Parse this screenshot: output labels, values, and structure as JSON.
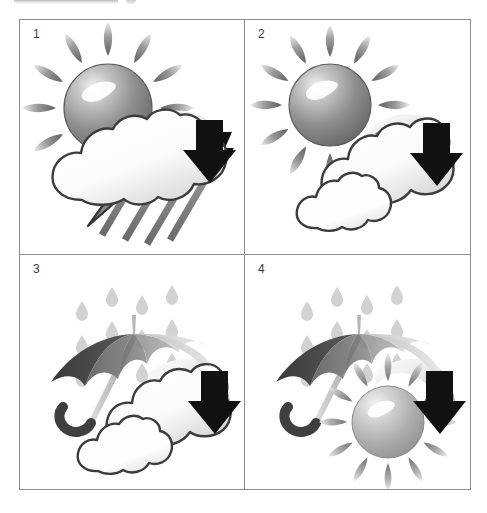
{
  "page": {
    "background_color": "#ffffff",
    "border_color": "#8e8e8e",
    "width": 487,
    "height": 513
  },
  "top_strip": {
    "name": "cropped-toolbar-strip",
    "color": "#bdbdbd"
  },
  "grid": {
    "columns": 2,
    "rows": 2,
    "cells": [
      {
        "number": "1",
        "caption": "Sun behind thunderstorm cloud with rain and lightning and down arrow",
        "elements": [
          "sun",
          "cloud",
          "lightning-bolt",
          "rain-streaks",
          "down-arrow"
        ]
      },
      {
        "number": "2",
        "caption": "Sun behind two clouds with down arrow",
        "elements": [
          "sun",
          "cloud-large",
          "cloud-small",
          "down-arrow"
        ]
      },
      {
        "number": "3",
        "caption": "Umbrella under falling rain drops with clouds and down arrow",
        "elements": [
          "rain-drops",
          "umbrella",
          "cloud-large",
          "cloud-small",
          "down-arrow"
        ]
      },
      {
        "number": "4",
        "caption": "Umbrella under falling rain drops with sun and down arrow",
        "elements": [
          "rain-drops",
          "umbrella",
          "sun",
          "down-arrow"
        ]
      }
    ]
  },
  "palette": {
    "sun_light": "#e9e9e9",
    "sun_mid": "#9c9c9c",
    "sun_dark": "#6e6e6e",
    "sun_pale_light": "#e3e3e3",
    "sun_pale_mid": "#b4b4b4",
    "cloud_light": "#ffffff",
    "cloud_shade": "#d9d9d9",
    "outline": "#3c3c3c",
    "arrow_black": "#111111",
    "arrow_fade": "#f2f2f2",
    "rain_drop": "#d2d2d2",
    "rain_streak": "#7a7a7a",
    "bolt_fill": "#8a8a8a",
    "umbrella_dark": "#4a4a4a",
    "umbrella_mid": "#8c8c8c",
    "umbrella_light": "#cfcfcf",
    "umbrella_pale": "#ececec",
    "handle": "#3f3f3f"
  }
}
